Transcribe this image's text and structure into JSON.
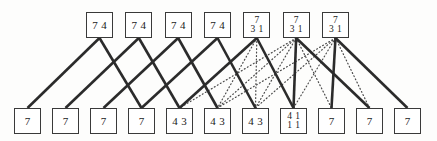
{
  "diagram": {
    "canvas": {
      "width": 437,
      "height": 141,
      "background": "#fdfdfc"
    },
    "style": {
      "node_border_color": "#3a3a3a",
      "node_fill": "#ffffff",
      "solid_edge_color": "#2b2b2b",
      "dotted_edge_color": "#4a4a4a",
      "solid_edge_width": 2.6,
      "dotted_edge_width": 1.2,
      "text_color": "#1a1a1a"
    },
    "top_row": {
      "name": "top-node-row",
      "count": 7,
      "x_start": 86,
      "x_pitch": 39.33,
      "y": 12,
      "box_width": 27,
      "box_height": 26,
      "nodes": [
        {
          "id": "top-1",
          "lines": [
            [
              "7",
              "4"
            ]
          ]
        },
        {
          "id": "top-2",
          "lines": [
            [
              "7",
              "4"
            ]
          ]
        },
        {
          "id": "top-3",
          "lines": [
            [
              "7",
              "4"
            ]
          ]
        },
        {
          "id": "top-4",
          "lines": [
            [
              "7",
              "4"
            ]
          ]
        },
        {
          "id": "top-5",
          "lines": [
            [
              "7"
            ],
            [
              "3",
              "1"
            ]
          ]
        },
        {
          "id": "top-6",
          "lines": [
            [
              "7"
            ],
            [
              "3",
              "1"
            ]
          ]
        },
        {
          "id": "top-7",
          "lines": [
            [
              "7"
            ],
            [
              "3",
              "1"
            ]
          ]
        }
      ]
    },
    "bottom_row": {
      "name": "bottom-node-row",
      "count": 11,
      "x_start": 14,
      "x_pitch": 38,
      "y": 108,
      "box_width": 27,
      "box_height": 26,
      "nodes": [
        {
          "id": "bot-1",
          "lines": [
            [
              "7"
            ]
          ]
        },
        {
          "id": "bot-2",
          "lines": [
            [
              "7"
            ]
          ]
        },
        {
          "id": "bot-3",
          "lines": [
            [
              "7"
            ]
          ]
        },
        {
          "id": "bot-4",
          "lines": [
            [
              "7"
            ]
          ]
        },
        {
          "id": "bot-5",
          "lines": [
            [
              "4",
              "3"
            ]
          ]
        },
        {
          "id": "bot-6",
          "lines": [
            [
              "4",
              "3"
            ]
          ]
        },
        {
          "id": "bot-7",
          "lines": [
            [
              "4",
              "3"
            ]
          ]
        },
        {
          "id": "bot-8",
          "lines": [
            [
              "4",
              "1"
            ],
            [
              "1",
              "1"
            ]
          ]
        },
        {
          "id": "bot-9",
          "lines": [
            [
              "7"
            ]
          ]
        },
        {
          "id": "bot-10",
          "lines": [
            [
              "7"
            ]
          ]
        },
        {
          "id": "bot-11",
          "lines": [
            [
              "7"
            ]
          ]
        }
      ]
    },
    "edges": {
      "solid": [
        {
          "from": 0,
          "to": 0
        },
        {
          "from": 0,
          "to": 3
        },
        {
          "from": 1,
          "to": 1
        },
        {
          "from": 1,
          "to": 4
        },
        {
          "from": 2,
          "to": 2
        },
        {
          "from": 2,
          "to": 5
        },
        {
          "from": 3,
          "to": 3
        },
        {
          "from": 3,
          "to": 6
        },
        {
          "from": 4,
          "to": 4
        },
        {
          "from": 4,
          "to": 7
        },
        {
          "from": 5,
          "to": 7
        },
        {
          "from": 5,
          "to": 9
        },
        {
          "from": 6,
          "to": 8
        },
        {
          "from": 6,
          "to": 10
        }
      ],
      "dotted": [
        {
          "from": 4,
          "to": 5
        },
        {
          "from": 4,
          "to": 6
        },
        {
          "from": 5,
          "to": 4
        },
        {
          "from": 5,
          "to": 5
        },
        {
          "from": 5,
          "to": 6
        },
        {
          "from": 5,
          "to": 8
        },
        {
          "from": 6,
          "to": 5
        },
        {
          "from": 6,
          "to": 6
        },
        {
          "from": 6,
          "to": 7
        },
        {
          "from": 6,
          "to": 9
        }
      ]
    }
  }
}
